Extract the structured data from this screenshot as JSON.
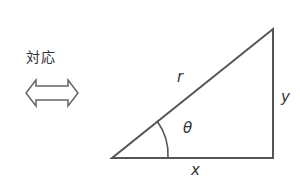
{
  "correspondence_label": "対応",
  "triangle": {
    "hypotenuse_label": "r",
    "opposite_label": "y",
    "adjacent_label": "x",
    "angle_label": "θ"
  },
  "colors": {
    "stroke": "#555555",
    "text": "#333333"
  }
}
